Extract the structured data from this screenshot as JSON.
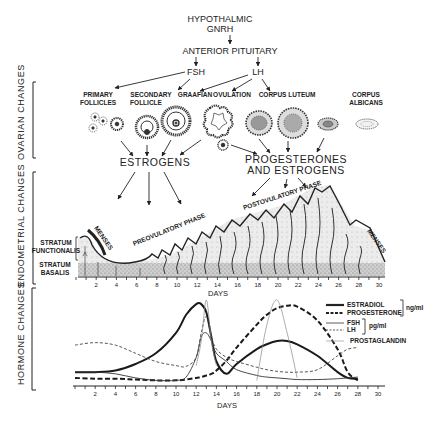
{
  "hierarchy": {
    "hypothalamus": "HYPOTHALMIC",
    "hypothalamus_line2": "GNRH",
    "pituitary": "ANTERIOR PITUITARY",
    "fsh": "FSH",
    "lh": "LH"
  },
  "ovarian": {
    "section_label": "OVARIAN CHANGES",
    "stages": [
      {
        "label_1": "PRIMARY",
        "label_2": "FOLLICLES"
      },
      {
        "label_1": "SECONDARY",
        "label_2": "FOLLICLE"
      },
      {
        "label_1": "GRAAFIAN",
        "label_2": ""
      },
      {
        "label_1": "OVULATION",
        "label_2": ""
      },
      {
        "label_1": "CORPUS LUTEUM",
        "label_2": ""
      },
      {
        "label_1": "CORPUS",
        "label_2": "ALBICANS"
      }
    ],
    "estrogens": "ESTROGENS",
    "progesterones_1": "PROGESTERONES",
    "progesterones_2": "AND ESTROGENS"
  },
  "endometrial": {
    "section_label": "ENDOMETRIAL CHANGES",
    "stratum_functionalis_1": "STRATUM",
    "stratum_functionalis_2": "FUNCTIONALIS",
    "stratum_basalis_1": "STRATUM",
    "stratum_basalis_2": "BASALIS",
    "menses_start": "MENSES",
    "preovulatory": "PREOVULATORY PHASE",
    "postovulatory": "POSTOVULATORY PHASE",
    "menses_end": "MENSES",
    "axis_label": "DAYS",
    "ticks": [
      "2",
      "4",
      "6",
      "8",
      "10",
      "12",
      "14",
      "16",
      "18",
      "20",
      "22",
      "24",
      "26",
      "28",
      "30"
    ]
  },
  "hormones": {
    "section_label": "HORMONE CHANGES",
    "axis_label": "DAYS",
    "ticks": [
      "2",
      "4",
      "6",
      "8",
      "10",
      "12",
      "14",
      "16",
      "18",
      "20",
      "22",
      "24",
      "26",
      "28",
      "30"
    ],
    "legend": {
      "estradiol": "ESTRADIOL",
      "progesterone": "PROGESTERONE",
      "unit_ng": "ng/ml",
      "fsh": "FSH",
      "lh": "LH",
      "unit_pg": "pg/ml",
      "prostaglandin": "PROSTAGLANDIN"
    }
  },
  "chart_data": {
    "type": "line",
    "xlabel": "DAYS",
    "ylabel": "",
    "xlim": [
      0,
      30
    ],
    "x": [
      0,
      2,
      4,
      6,
      8,
      10,
      11,
      12,
      12.5,
      13,
      13.5,
      14,
      15,
      16,
      18,
      19,
      20,
      21,
      22,
      24,
      26,
      27,
      28
    ],
    "series": [
      {
        "name": "ESTRADIOL",
        "unit": "ng/ml",
        "style": "thick solid",
        "values": [
          0.12,
          0.12,
          0.14,
          0.22,
          0.35,
          0.6,
          0.82,
          0.95,
          0.95,
          0.85,
          0.55,
          0.25,
          0.1,
          0.22,
          0.4,
          0.46,
          0.5,
          0.5,
          0.46,
          0.32,
          0.12,
          0.05,
          0.04
        ]
      },
      {
        "name": "PROGESTERONE",
        "unit": "ng/ml",
        "style": "thick dashed",
        "values": [
          0.05,
          0.04,
          0.04,
          0.03,
          0.02,
          0.02,
          0.03,
          0.05,
          0.06,
          0.08,
          0.1,
          0.14,
          0.26,
          0.42,
          0.7,
          0.82,
          0.9,
          0.93,
          0.92,
          0.75,
          0.4,
          0.12,
          0.02
        ]
      },
      {
        "name": "FSH",
        "unit": "pg/ml",
        "style": "thin solid",
        "values": [
          0.12,
          0.12,
          0.1,
          0.05,
          0.02,
          0.02,
          0.06,
          0.3,
          0.55,
          0.6,
          0.5,
          0.35,
          0.25,
          0.15,
          0.08,
          0.06,
          0.05,
          0.04,
          0.03,
          0.03,
          0.04,
          0.05,
          0.06
        ]
      },
      {
        "name": "LH",
        "unit": "pg/ml",
        "style": "thin dashed",
        "values": [
          0.45,
          0.48,
          0.45,
          0.35,
          0.25,
          0.2,
          0.19,
          0.3,
          0.6,
          0.8,
          0.55,
          0.4,
          0.3,
          0.25,
          0.18,
          0.15,
          0.13,
          0.12,
          0.12,
          0.15,
          0.32,
          0.4,
          0.42
        ]
      },
      {
        "name": "PROSTAGLANDIN",
        "unit": "",
        "style": "faint solid",
        "values": [
          null,
          null,
          null,
          null,
          null,
          null,
          null,
          0.2,
          0.5,
          1.0,
          0.5,
          0.2,
          null,
          null,
          0.02,
          0.7,
          1.0,
          0.6,
          0.05,
          null,
          null,
          null,
          null
        ]
      }
    ],
    "legend_position": "upper right",
    "grid": false
  }
}
